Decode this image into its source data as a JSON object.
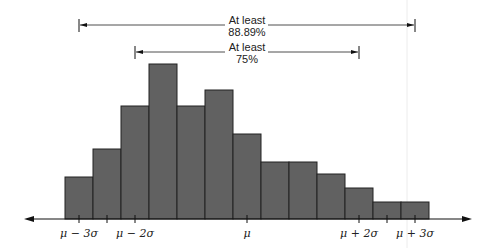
{
  "chart_data": {
    "type": "bar",
    "title": "",
    "xlabel": "",
    "ylabel": "",
    "grid": false,
    "categories": [
      "1",
      "2",
      "3",
      "4",
      "5",
      "6",
      "7",
      "8",
      "9",
      "10",
      "11",
      "12",
      "13"
    ],
    "values": [
      42,
      70,
      113,
      155,
      113,
      129,
      85,
      57,
      57,
      45,
      31,
      17,
      17
    ],
    "bar_color": "#616161",
    "edge_color": "#222222",
    "tick_labels": [
      "μ − 3σ",
      "",
      "μ − 2σ",
      "μ",
      "μ + 2σ",
      "",
      "μ + 3σ"
    ],
    "annotations": [
      {
        "text_line1": "At least",
        "text_line2": "88.89%",
        "range": "μ − 3σ to μ + 3σ"
      },
      {
        "text_line1": "At least",
        "text_line2": "75%",
        "range": "μ − 2σ to μ + 2σ"
      }
    ]
  },
  "labels": {
    "mu_minus_3sigma": "μ − 3σ",
    "mu_minus_2sigma": "μ − 2σ",
    "mu": "μ",
    "mu_plus_2sigma": "μ + 2σ",
    "mu_plus_3sigma": "μ + 3σ",
    "outer_line1": "At least",
    "outer_line2": "88.89%",
    "inner_line1": "At least",
    "inner_line2": "75%"
  }
}
